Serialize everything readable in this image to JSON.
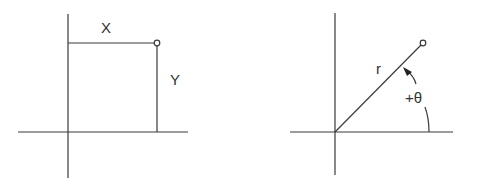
{
  "diagram": {
    "left": {
      "title": "Cartesian coordinates",
      "x_label": "X",
      "y_label": "Y"
    },
    "right": {
      "title": "Polar coordinates",
      "r_label": "r",
      "theta_label": "+θ"
    },
    "colors": {
      "line": "#3a3a3a",
      "text": "#333333",
      "background": "#ffffff"
    }
  }
}
